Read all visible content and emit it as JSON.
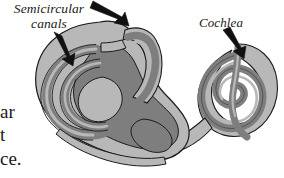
{
  "figure": {
    "background_color": "#ffffff"
  },
  "labels": {
    "semicircular_canals": {
      "line1": "Semicircular",
      "line2": "canals"
    },
    "cochlea": "Cochlea"
  },
  "body_text_fragments": {
    "line1": "ar",
    "line2": "t",
    "line3": "ce."
  },
  "arrows": [
    {
      "name": "arrow-to-semicircular-canals-left",
      "points_to": "lateral semicircular canal",
      "color": "#111111"
    },
    {
      "name": "arrow-to-semicircular-canals-top",
      "points_to": "superior semicircular canal",
      "color": "#111111"
    },
    {
      "name": "arrow-to-cochlea",
      "points_to": "cochlea spiral",
      "color": "#111111"
    }
  ],
  "colors": {
    "outline": "#1b1b1b",
    "light_gray": "#b8b8b8",
    "mid_gray": "#9a9a9a",
    "dark_gray": "#7e7e7e",
    "text": "#1a1a1a",
    "background": "#ffffff"
  },
  "anatomy_parts": [
    "superior semicircular canal",
    "lateral semicircular canal",
    "posterior semicircular canal",
    "vestibule",
    "cochlea",
    "cochlear duct"
  ]
}
